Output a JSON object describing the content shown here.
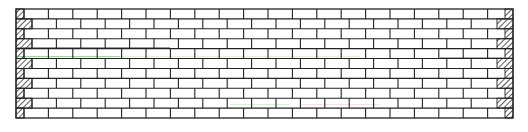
{
  "diagram": {
    "type": "brick-wall-elevation",
    "bond": "running-bond",
    "canvas": {
      "width": 528,
      "height": 132,
      "background": "#ffffff"
    },
    "wall": {
      "x": 16,
      "y": 9,
      "width": 497,
      "height": 109,
      "rows": 11
    },
    "brick": {
      "length": 24.4,
      "course_height": 9.9
    },
    "end_piece_widths": {
      "even_rows": 8,
      "odd_rows": 16
    },
    "line_color": "#222222",
    "hatch_color": "#333333",
    "artifact_lines": [
      {
        "color": "#3a3acc",
        "y": 47.5,
        "x1": 17,
        "x2": 170,
        "opacity": 0.55
      },
      {
        "color": "#3aa03a",
        "y": 56.5,
        "x1": 17,
        "x2": 120,
        "opacity": 0.45
      },
      {
        "color": "#b8e0a0",
        "y": 56.5,
        "x1": 120,
        "x2": 360,
        "opacity": 0.4
      },
      {
        "color": "#cc3344",
        "y": 57.5,
        "x1": 440,
        "x2": 512,
        "opacity": 0.5
      },
      {
        "color": "#a0e0a0",
        "y": 104.5,
        "x1": 230,
        "x2": 290,
        "opacity": 0.4
      },
      {
        "color": "#e0a0b0",
        "y": 104.5,
        "x1": 300,
        "x2": 380,
        "opacity": 0.3
      }
    ]
  }
}
